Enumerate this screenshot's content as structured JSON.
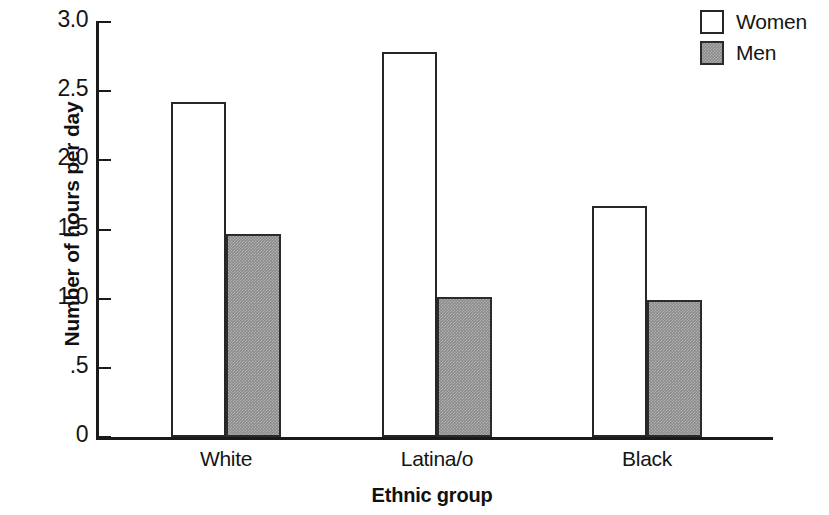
{
  "chart_data": {
    "type": "bar",
    "title": "",
    "xlabel": "Ethnic group",
    "ylabel": "Number of hours per day",
    "categories": [
      "White",
      "Latina/o",
      "Black"
    ],
    "series": [
      {
        "name": "Women",
        "values": [
          2.42,
          2.78,
          1.67
        ],
        "fill": "#ffffff",
        "stroke": "#262626"
      },
      {
        "name": "Men",
        "values": [
          1.47,
          1.01,
          0.99
        ],
        "fill": "#8a8a8a",
        "stroke": "#2b2b2b"
      }
    ],
    "ylim": [
      0,
      3.0
    ],
    "ytick_values": [
      3.0,
      2.5,
      2.0,
      1.5,
      1.0,
      0.5,
      0
    ],
    "ytick_labels": [
      "3.0",
      "2.5",
      "2.0",
      "1.5",
      "1.0",
      ".5",
      "0"
    ],
    "grid": false,
    "legend_position": "top-right",
    "legend_entries": [
      "Women",
      "Men"
    ]
  }
}
